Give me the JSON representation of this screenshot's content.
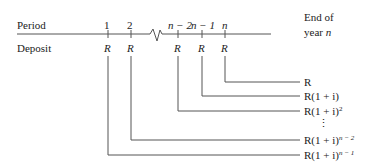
{
  "row_labels": {
    "period": "Period",
    "deposit": "Deposit"
  },
  "end_label": {
    "line1": "End of",
    "line2_prefix": "year ",
    "line2_var": "n"
  },
  "periods": [
    {
      "label": "1",
      "deposit": "R"
    },
    {
      "label": "2",
      "deposit": "R"
    },
    {
      "label": "n − 2",
      "deposit": "R"
    },
    {
      "label": "n − 1",
      "deposit": "R"
    },
    {
      "label": "n",
      "deposit": "R"
    }
  ],
  "future_values": [
    {
      "base": "R",
      "exp": ""
    },
    {
      "base": "R(1 + i)",
      "exp": ""
    },
    {
      "base": "R(1 + i)",
      "exp": "2"
    },
    {
      "base": "⋮",
      "exp": ""
    },
    {
      "base": "R(1 + i)",
      "exp": "n − 2"
    },
    {
      "base": "R(1 + i)",
      "exp": "n − 1"
    }
  ],
  "colors": {
    "line": "#555555",
    "text": "#222222"
  }
}
